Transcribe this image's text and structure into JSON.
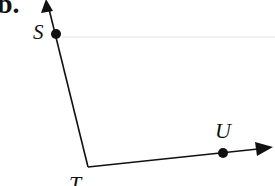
{
  "figure": {
    "part_label": "b.",
    "points": {
      "S": {
        "label": "S",
        "x": 56,
        "y": 34
      },
      "T": {
        "label": "T",
        "x": 88,
        "y": 167
      },
      "U": {
        "label": "U",
        "x": 223,
        "y": 153
      }
    },
    "rays": [
      {
        "name": "ray-TS",
        "from": "T",
        "through": "S",
        "arrow_tip": [
          47,
          1
        ]
      },
      {
        "name": "ray-TU",
        "from": "T",
        "through": "U",
        "arrow_tip": [
          272,
          148
        ]
      }
    ],
    "angle": "STU",
    "colors": {
      "ink": "#111111",
      "guide_line": "#e4e4e4",
      "background": "#ffffff"
    }
  }
}
